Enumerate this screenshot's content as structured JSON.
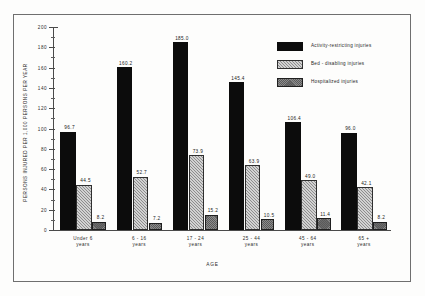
{
  "chart_data": {
    "type": "bar",
    "title": "",
    "xlabel": "AGE",
    "ylabel": "PERSONS INJURED PER 1,000 PERSONS PER YEAR",
    "ylim": [
      0,
      200
    ],
    "yticks": [
      0,
      20,
      40,
      60,
      80,
      100,
      120,
      140,
      160,
      180,
      200
    ],
    "grid": false,
    "legend_position": "top-right",
    "categories": [
      "Under 6\nyears",
      "6 - 16\nyears",
      "17 - 24\nyears",
      "25 - 44\nyears",
      "45 - 64\nyears",
      "65 +\nyears"
    ],
    "category_lines": [
      [
        "Under 6",
        "years"
      ],
      [
        "6 - 16",
        "years"
      ],
      [
        "17 - 24",
        "years"
      ],
      [
        "25 - 44",
        "years"
      ],
      [
        "45 - 64",
        "years"
      ],
      [
        "65 +",
        "years"
      ]
    ],
    "series": [
      {
        "name": "Activity-restricting injuries",
        "pattern": "solid-black",
        "color": "#0c0c0c",
        "values": [
          96.7,
          160.2,
          185.0,
          145.4,
          106.4,
          96.0
        ],
        "labels": [
          "96.7",
          "160.2",
          "185.0",
          "145.4",
          "106.4",
          "96.0"
        ]
      },
      {
        "name": "Bed - disabling injuries",
        "pattern": "diagonal-hatch-light",
        "color": "#d2d2d2",
        "values": [
          44.5,
          52.7,
          73.9,
          63.9,
          49.0,
          42.1
        ],
        "labels": [
          "44.5",
          "52.7",
          "73.9",
          "63.9",
          "49.0",
          "42.1"
        ]
      },
      {
        "name": "Hospitalized injuries",
        "pattern": "cross-stipple-gray",
        "color": "#8c8c8c",
        "values": [
          8.2,
          7.2,
          15.2,
          10.5,
          11.4,
          8.2
        ],
        "labels": [
          "8.2",
          "7.2",
          "15.2",
          "10.5",
          "11.4",
          "8.2"
        ]
      }
    ]
  }
}
